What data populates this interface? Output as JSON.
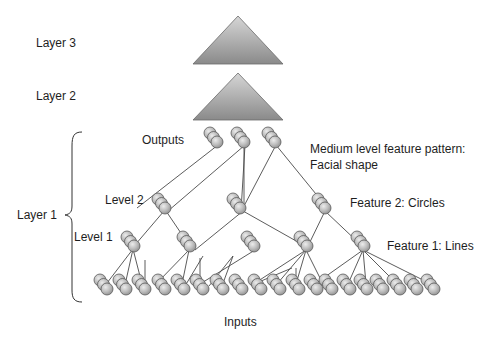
{
  "labels": {
    "layer3": "Layer 3",
    "layer2": "Layer 2",
    "layer1": "Layer 1",
    "outputs": "Outputs",
    "level2": "Level 2",
    "level1": "Level 1",
    "inputs": "Inputs",
    "medium_feature_line1": "Medium level feature pattern:",
    "medium_feature_line2": "Facial shape",
    "feature2": "Feature 2: Circles",
    "feature1": "Feature 1: Lines"
  },
  "colors": {
    "sphere_light": "#e6e6e6",
    "sphere_dark": "#9a9a9a",
    "triangle_light": "#d0d0d0",
    "triangle_dark": "#8c8c8c",
    "edge": "#4a4a4a"
  },
  "triangles": [
    {
      "name": "layer-3-triangle",
      "apex": [
        238,
        16
      ],
      "base_left": [
        193,
        64
      ],
      "base_right": [
        283,
        64
      ]
    },
    {
      "name": "layer-2-triangle",
      "apex": [
        238,
        73
      ],
      "base_left": [
        193,
        120
      ],
      "base_right": [
        283,
        120
      ]
    }
  ],
  "nodes": {
    "outputs": [
      [
        210,
        133
      ],
      [
        237,
        133
      ],
      [
        268,
        133
      ]
    ],
    "level2": [
      [
        158,
        199
      ],
      [
        233,
        199
      ],
      [
        318,
        199
      ]
    ],
    "level1": [
      [
        127,
        237
      ],
      [
        183,
        237
      ],
      [
        247,
        237
      ],
      [
        300,
        237
      ],
      [
        357,
        237
      ]
    ],
    "inputs": [
      [
        100,
        280
      ],
      [
        119,
        280
      ],
      [
        138,
        280
      ],
      [
        158,
        280
      ],
      [
        177,
        280
      ],
      [
        196,
        280
      ],
      [
        216,
        280
      ],
      [
        235,
        280
      ],
      [
        254,
        280
      ],
      [
        273,
        280
      ],
      [
        292,
        280
      ],
      [
        310,
        280
      ],
      [
        325,
        280
      ],
      [
        343,
        280
      ],
      [
        360,
        280
      ],
      [
        376,
        280
      ],
      [
        393,
        280
      ],
      [
        410,
        280
      ],
      [
        427,
        280
      ]
    ]
  },
  "edges": [
    [
      [
        218,
        145
      ],
      [
        137,
        208
      ]
    ],
    [
      [
        245,
        145
      ],
      [
        168,
        211
      ]
    ],
    [
      [
        245,
        145
      ],
      [
        241,
        211
      ]
    ],
    [
      [
        244,
        145
      ],
      [
        244,
        208
      ]
    ],
    [
      [
        276,
        145
      ],
      [
        244,
        206
      ]
    ],
    [
      [
        276,
        145
      ],
      [
        329,
        210
      ]
    ],
    [
      [
        164,
        211
      ],
      [
        135,
        245
      ]
    ],
    [
      [
        166,
        211
      ],
      [
        189,
        245
      ]
    ],
    [
      [
        243,
        211
      ],
      [
        195,
        250
      ]
    ],
    [
      [
        243,
        211
      ],
      [
        305,
        246
      ]
    ],
    [
      [
        325,
        211
      ],
      [
        308,
        246
      ]
    ],
    [
      [
        325,
        211
      ],
      [
        362,
        246
      ]
    ],
    [
      [
        133,
        249
      ],
      [
        107,
        283
      ]
    ],
    [
      [
        133,
        249
      ],
      [
        125,
        285
      ]
    ],
    [
      [
        133,
        249
      ],
      [
        142,
        284
      ]
    ],
    [
      [
        189,
        250
      ],
      [
        156,
        284
      ]
    ],
    [
      [
        189,
        250
      ],
      [
        182,
        284
      ]
    ],
    [
      [
        255,
        250
      ],
      [
        200,
        284
      ]
    ],
    [
      [
        306,
        250
      ],
      [
        252,
        285
      ]
    ],
    [
      [
        306,
        250
      ],
      [
        277,
        284
      ]
    ],
    [
      [
        306,
        250
      ],
      [
        296,
        284
      ]
    ],
    [
      [
        306,
        250
      ],
      [
        323,
        284
      ]
    ],
    [
      [
        363,
        250
      ],
      [
        315,
        284
      ]
    ],
    [
      [
        363,
        250
      ],
      [
        348,
        284
      ]
    ],
    [
      [
        363,
        250
      ],
      [
        366,
        284
      ]
    ],
    [
      [
        363,
        250
      ],
      [
        397,
        284
      ]
    ],
    [
      [
        363,
        250
      ],
      [
        431,
        284
      ]
    ],
    [
      [
        145,
        260
      ],
      [
        145,
        282
      ]
    ],
    [
      [
        200,
        258
      ],
      [
        200,
        282
      ]
    ],
    [
      [
        203,
        256
      ],
      [
        185,
        286
      ]
    ],
    [
      [
        233,
        256
      ],
      [
        209,
        286
      ]
    ],
    [
      [
        233,
        256
      ],
      [
        222,
        286
      ]
    ],
    [
      [
        292,
        268
      ],
      [
        254,
        284
      ]
    ],
    [
      [
        296,
        268
      ],
      [
        296,
        282
      ]
    ]
  ]
}
